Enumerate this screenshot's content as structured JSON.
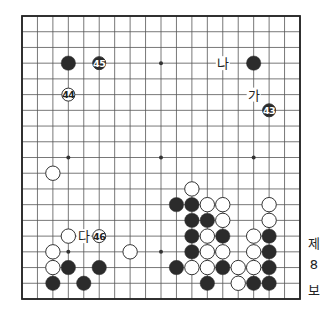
{
  "diagram": {
    "type": "go-board",
    "size": 19,
    "board": {
      "left": 22,
      "top": 16,
      "right": 300,
      "bottom": 299
    },
    "colors": {
      "line": "#555555",
      "border": "#222222",
      "black": "#2b2b2b",
      "white": "#ffffff",
      "star": "#333333"
    },
    "star_points": [
      [
        3,
        3
      ],
      [
        9,
        3
      ],
      [
        15,
        3
      ],
      [
        3,
        9
      ],
      [
        9,
        9
      ],
      [
        15,
        9
      ],
      [
        3,
        15
      ],
      [
        9,
        15
      ],
      [
        15,
        15
      ]
    ],
    "stones": [
      {
        "col": 3,
        "row": 3,
        "color": "black"
      },
      {
        "col": 15,
        "row": 3,
        "color": "black"
      },
      {
        "col": 2,
        "row": 10,
        "color": "white"
      },
      {
        "col": 11,
        "row": 11,
        "color": "white"
      },
      {
        "col": 10,
        "row": 12,
        "color": "black"
      },
      {
        "col": 11,
        "row": 12,
        "color": "black"
      },
      {
        "col": 12,
        "row": 12,
        "color": "white"
      },
      {
        "col": 13,
        "row": 12,
        "color": "white"
      },
      {
        "col": 16,
        "row": 12,
        "color": "white"
      },
      {
        "col": 11,
        "row": 13,
        "color": "black"
      },
      {
        "col": 12,
        "row": 13,
        "color": "black"
      },
      {
        "col": 13,
        "row": 13,
        "color": "white"
      },
      {
        "col": 16,
        "row": 13,
        "color": "white"
      },
      {
        "col": 3,
        "row": 14,
        "color": "white"
      },
      {
        "col": 11,
        "row": 14,
        "color": "black"
      },
      {
        "col": 12,
        "row": 14,
        "color": "white"
      },
      {
        "col": 13,
        "row": 14,
        "color": "black"
      },
      {
        "col": 15,
        "row": 14,
        "color": "white"
      },
      {
        "col": 16,
        "row": 14,
        "color": "black"
      },
      {
        "col": 2,
        "row": 15,
        "color": "white"
      },
      {
        "col": 7,
        "row": 15,
        "color": "white"
      },
      {
        "col": 11,
        "row": 15,
        "color": "black"
      },
      {
        "col": 12,
        "row": 15,
        "color": "white"
      },
      {
        "col": 13,
        "row": 15,
        "color": "white"
      },
      {
        "col": 15,
        "row": 15,
        "color": "white"
      },
      {
        "col": 16,
        "row": 15,
        "color": "black"
      },
      {
        "col": 2,
        "row": 16,
        "color": "white"
      },
      {
        "col": 3,
        "row": 16,
        "color": "black"
      },
      {
        "col": 5,
        "row": 16,
        "color": "black"
      },
      {
        "col": 10,
        "row": 16,
        "color": "black"
      },
      {
        "col": 11,
        "row": 16,
        "color": "white"
      },
      {
        "col": 12,
        "row": 16,
        "color": "white"
      },
      {
        "col": 13,
        "row": 16,
        "color": "black"
      },
      {
        "col": 14,
        "row": 16,
        "color": "white"
      },
      {
        "col": 15,
        "row": 16,
        "color": "white"
      },
      {
        "col": 16,
        "row": 16,
        "color": "black"
      },
      {
        "col": 2,
        "row": 17,
        "color": "black"
      },
      {
        "col": 4,
        "row": 17,
        "color": "black"
      },
      {
        "col": 12,
        "row": 17,
        "color": "black"
      },
      {
        "col": 14,
        "row": 17,
        "color": "white"
      },
      {
        "col": 15,
        "row": 17,
        "color": "black"
      },
      {
        "col": 16,
        "row": 17,
        "color": "black"
      }
    ],
    "numbered_stones": [
      {
        "col": 16,
        "row": 6,
        "color": "black",
        "number": "43"
      },
      {
        "col": 3,
        "row": 5,
        "color": "white",
        "number": "44"
      },
      {
        "col": 5,
        "row": 3,
        "color": "black",
        "number": "45"
      },
      {
        "col": 5,
        "row": 14,
        "color": "white",
        "number": "46"
      }
    ],
    "letter_marks": [
      {
        "col": 15,
        "row": 5,
        "text": "가"
      },
      {
        "col": 13,
        "row": 3,
        "text": "나"
      },
      {
        "col": 4,
        "row": 14,
        "text": "다"
      }
    ]
  },
  "caption": {
    "line1": "제",
    "line2": "8",
    "line3": "보"
  }
}
